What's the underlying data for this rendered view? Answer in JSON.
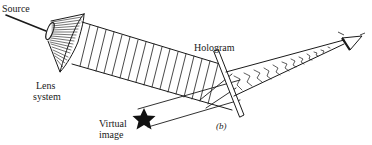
{
  "figure": {
    "panel_label": "(b)",
    "labels": {
      "source": "Source",
      "lens_system_line1": "Lens",
      "lens_system_line2": "system",
      "hologram": "Hologram",
      "virtual_image_line1": "Virtual",
      "virtual_image_line2": "image"
    },
    "icons": {
      "object": "star-icon",
      "observer": "eye-icon"
    },
    "colors": {
      "ink": "#1a1a1a",
      "background": "#ffffff"
    }
  }
}
